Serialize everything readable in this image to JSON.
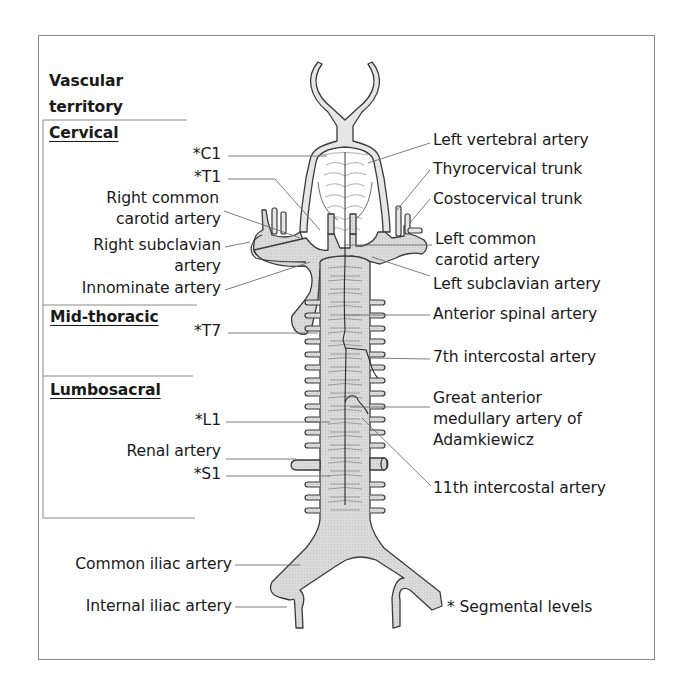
{
  "figure": {
    "heading": [
      "Vascular",
      "territory"
    ],
    "territories": [
      "Cervical",
      "Mid-thoracic",
      "Lumbosacral"
    ],
    "left_labels": {
      "c1": "*C1",
      "t1": "*T1",
      "right_common_carotid": [
        "Right common",
        "carotid artery"
      ],
      "right_subclavian": [
        "Right subclavian",
        "artery"
      ],
      "innominate": "Innominate artery",
      "t7": "*T7",
      "l1": "*L1",
      "renal": "Renal artery",
      "s1": "*S1",
      "common_iliac": "Common iliac artery",
      "internal_iliac": "Internal iliac artery"
    },
    "right_labels": {
      "left_vertebral": "Left vertebral artery",
      "thyrocervical": "Thyrocervical trunk",
      "costocervical": "Costocervical trunk",
      "left_common_carotid": [
        "Left common",
        "carotid artery"
      ],
      "left_subclavian": "Left subclavian artery",
      "anterior_spinal": "Anterior spinal artery",
      "intercostal_7": "7th intercostal artery",
      "adamkiewicz": [
        "Great anterior",
        "medullary artery of",
        "Adamkiewicz"
      ],
      "intercostal_11": "11th intercostal artery"
    },
    "footnote": "* Segmental levels",
    "colors": {
      "vessel_fill": "#d9d9d9",
      "outline": "#3a3a3a",
      "leader": "#6e6e6e",
      "frame": "#8a8a8a"
    }
  }
}
